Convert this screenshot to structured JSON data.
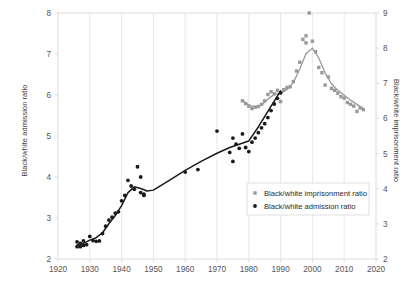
{
  "chart_data": {
    "type": "scatter",
    "title": "",
    "xlabel": "",
    "ylabel": "Black/white admission ratio",
    "y2label": "Black/white imprisonment ratio",
    "xlim": [
      1920,
      2020
    ],
    "ylim": [
      2,
      8
    ],
    "y2lim": [
      2,
      9
    ],
    "grid": true,
    "grid_axis": "x",
    "legend_position": "center-right",
    "xticks": [
      1920,
      1930,
      1940,
      1950,
      1960,
      1970,
      1980,
      1990,
      2000,
      2010,
      2020
    ],
    "xtick_labels": [
      "1920",
      "1930",
      "1940",
      "1950",
      "1960",
      "1970",
      "1980",
      "1990",
      "2000",
      "2010",
      "2020"
    ],
    "yticks": [
      2,
      3,
      4,
      5,
      6,
      7,
      8
    ],
    "ytick_labels": [
      "2",
      "3",
      "4",
      "5",
      "6",
      "7",
      "8"
    ],
    "y2ticks": [
      2,
      3,
      4,
      5,
      6,
      7,
      8,
      9
    ],
    "y2tick_labels": [
      "2",
      "3",
      "4",
      "5",
      "6",
      "7",
      "8",
      "9"
    ],
    "series": [
      {
        "name": "Black/white admission ratio",
        "axis": "left",
        "marker": "circle",
        "color": "#1a1a1a",
        "has_trend_line": true,
        "points": [
          [
            1926,
            2.42
          ],
          [
            1926,
            2.3
          ],
          [
            1927,
            2.38
          ],
          [
            1927,
            2.3
          ],
          [
            1928,
            2.33
          ],
          [
            1928,
            2.44
          ],
          [
            1929,
            2.35
          ],
          [
            1930,
            2.55
          ],
          [
            1931,
            2.45
          ],
          [
            1932,
            2.43
          ],
          [
            1933,
            2.44
          ],
          [
            1934,
            2.62
          ],
          [
            1935,
            2.8
          ],
          [
            1936,
            2.95
          ],
          [
            1937,
            3.02
          ],
          [
            1938,
            3.12
          ],
          [
            1939,
            3.15
          ],
          [
            1940,
            3.42
          ],
          [
            1941,
            3.55
          ],
          [
            1942,
            3.92
          ],
          [
            1943,
            3.78
          ],
          [
            1944,
            3.7
          ],
          [
            1945,
            4.25
          ],
          [
            1946,
            3.62
          ],
          [
            1946,
            4.0
          ],
          [
            1947,
            3.58
          ],
          [
            1947,
            3.55
          ],
          [
            1960,
            4.12
          ],
          [
            1964,
            4.18
          ],
          [
            1970,
            5.12
          ],
          [
            1974,
            4.6
          ],
          [
            1975,
            4.95
          ],
          [
            1975,
            4.38
          ],
          [
            1976,
            4.8
          ],
          [
            1977,
            4.7
          ],
          [
            1978,
            5.05
          ],
          [
            1979,
            4.72
          ],
          [
            1980,
            4.62
          ],
          [
            1981,
            4.85
          ],
          [
            1982,
            4.95
          ],
          [
            1983,
            5.08
          ],
          [
            1984,
            5.2
          ],
          [
            1985,
            5.3
          ],
          [
            1986,
            5.45
          ],
          [
            1987,
            5.62
          ],
          [
            1988,
            5.78
          ],
          [
            1989,
            5.92
          ],
          [
            1990,
            6.05
          ]
        ],
        "trend": [
          [
            1926,
            2.34
          ],
          [
            1928,
            2.38
          ],
          [
            1930,
            2.46
          ],
          [
            1932,
            2.52
          ],
          [
            1934,
            2.64
          ],
          [
            1936,
            2.86
          ],
          [
            1938,
            3.06
          ],
          [
            1940,
            3.3
          ],
          [
            1942,
            3.62
          ],
          [
            1944,
            3.76
          ],
          [
            1946,
            3.72
          ],
          [
            1948,
            3.66
          ],
          [
            1950,
            3.68
          ],
          [
            1955,
            3.92
          ],
          [
            1960,
            4.16
          ],
          [
            1965,
            4.38
          ],
          [
            1970,
            4.58
          ],
          [
            1974,
            4.72
          ],
          [
            1977,
            4.8
          ],
          [
            1980,
            4.88
          ],
          [
            1983,
            5.22
          ],
          [
            1986,
            5.6
          ],
          [
            1990,
            6.1
          ]
        ]
      },
      {
        "name": "Black/white imprisonment ratio",
        "axis": "right",
        "marker": "square",
        "color": "#999999",
        "has_trend_line": true,
        "points": [
          [
            1978,
            6.5
          ],
          [
            1979,
            6.42
          ],
          [
            1980,
            6.35
          ],
          [
            1981,
            6.28
          ],
          [
            1982,
            6.32
          ],
          [
            1983,
            6.34
          ],
          [
            1984,
            6.4
          ],
          [
            1985,
            6.5
          ],
          [
            1986,
            6.68
          ],
          [
            1987,
            6.76
          ],
          [
            1988,
            6.7
          ],
          [
            1989,
            6.8
          ],
          [
            1990,
            6.48
          ],
          [
            1991,
            6.82
          ],
          [
            1992,
            6.88
          ],
          [
            1993,
            6.9
          ],
          [
            1994,
            7.05
          ],
          [
            1995,
            7.35
          ],
          [
            1996,
            7.6
          ],
          [
            1997,
            8.25
          ],
          [
            1998,
            8.15
          ],
          [
            1998,
            8.35
          ],
          [
            1999,
            9.0
          ],
          [
            2000,
            8.2
          ],
          [
            2001,
            7.9
          ],
          [
            2002,
            7.45
          ],
          [
            2003,
            7.3
          ],
          [
            2004,
            6.95
          ],
          [
            2005,
            7.18
          ],
          [
            2006,
            6.85
          ],
          [
            2007,
            6.8
          ],
          [
            2008,
            6.72
          ],
          [
            2009,
            6.62
          ],
          [
            2010,
            6.58
          ],
          [
            2011,
            6.45
          ],
          [
            2012,
            6.4
          ],
          [
            2013,
            6.35
          ],
          [
            2014,
            6.2
          ],
          [
            2015,
            6.3
          ],
          [
            2016,
            6.25
          ]
        ],
        "trend": [
          [
            1978,
            6.52
          ],
          [
            1980,
            6.38
          ],
          [
            1982,
            6.32
          ],
          [
            1984,
            6.38
          ],
          [
            1986,
            6.55
          ],
          [
            1988,
            6.68
          ],
          [
            1990,
            6.72
          ],
          [
            1992,
            6.82
          ],
          [
            1994,
            7.02
          ],
          [
            1996,
            7.4
          ],
          [
            1998,
            7.85
          ],
          [
            2000,
            8.0
          ],
          [
            2002,
            7.72
          ],
          [
            2004,
            7.3
          ],
          [
            2006,
            6.98
          ],
          [
            2008,
            6.8
          ],
          [
            2010,
            6.66
          ],
          [
            2012,
            6.52
          ],
          [
            2014,
            6.4
          ],
          [
            2016,
            6.28
          ]
        ]
      }
    ],
    "legend": [
      {
        "label": "Black/white imprisonment ratio",
        "marker": "square",
        "color": "#999999"
      },
      {
        "label": "Black/white admission ratio",
        "marker": "circle",
        "color": "#1a1a1a"
      }
    ]
  },
  "colors": {
    "admission": "#1a1a1a",
    "imprisonment": "#999999",
    "grid": "#e8e8e8",
    "border": "#dcdcdc",
    "tick_text": "#555555",
    "axis_title": "#3c3c3c",
    "background": "#ffffff"
  }
}
